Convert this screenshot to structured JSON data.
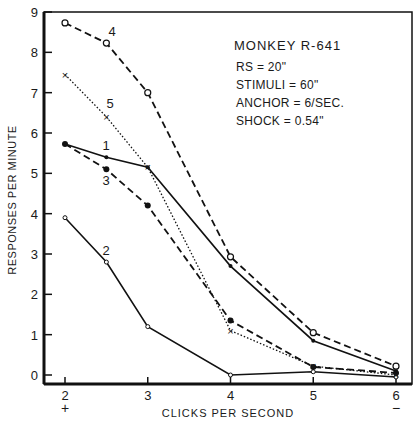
{
  "chart_data": {
    "type": "line",
    "title": "",
    "xlabel": "CLICKS PER SECOND",
    "ylabel": "RESPONSES PER MINUTE",
    "xlim": [
      2,
      6
    ],
    "ylim": [
      0,
      9
    ],
    "x_ticks": [
      "2",
      "3",
      "4",
      "5",
      "6"
    ],
    "x_tick_sublabels": {
      "2": "+",
      "6": "−"
    },
    "y_ticks": [
      "0",
      "1",
      "2",
      "3",
      "4",
      "5",
      "6",
      "7",
      "8",
      "9"
    ],
    "grid": false,
    "annotation": {
      "lines": [
        "MONKEY R-641",
        "RS = 20\"",
        "STIMULI = 60\"",
        "ANCHOR = 6/SEC.",
        "SHOCK = 0.54\""
      ]
    },
    "x": [
      2,
      2.5,
      3,
      4,
      5,
      6
    ],
    "series": [
      {
        "name": "1",
        "style": "solid",
        "marker": "small-dot",
        "values": [
          5.73,
          5.4,
          5.15,
          2.7,
          0.85,
          0.1
        ]
      },
      {
        "name": "2",
        "style": "solid",
        "marker": "open-small",
        "values": [
          3.9,
          2.8,
          1.2,
          0.0,
          0.08,
          -0.05
        ]
      },
      {
        "name": "3",
        "style": "dashed",
        "marker": "filled-circle",
        "values": [
          5.73,
          5.1,
          4.2,
          1.35,
          0.2,
          0.05
        ]
      },
      {
        "name": "4",
        "style": "dashed",
        "marker": "open-circle",
        "values": [
          8.73,
          8.23,
          7.0,
          2.93,
          1.05,
          0.22
        ]
      },
      {
        "name": "5",
        "style": "dotted",
        "marker": "x",
        "values": [
          7.45,
          6.4,
          5.15,
          1.1,
          0.22,
          0.0
        ]
      }
    ]
  }
}
